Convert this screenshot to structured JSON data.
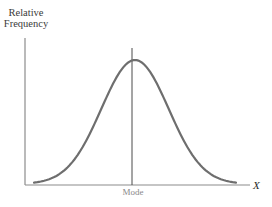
{
  "chart_data": {
    "type": "line",
    "title": "",
    "xlabel": "X",
    "ylabel": "Relative Frequency",
    "annotations": [
      {
        "label": "Mode",
        "position": "center, at peak of distribution"
      }
    ],
    "x": [
      -3,
      -2.5,
      -2,
      -1.5,
      -1,
      -0.5,
      0,
      0.5,
      1,
      1.5,
      2,
      2.5,
      3
    ],
    "series": [
      {
        "name": "Relative Frequency",
        "values": [
          0.011,
          0.044,
          0.135,
          0.325,
          0.607,
          0.882,
          1.0,
          0.882,
          0.607,
          0.325,
          0.135,
          0.044,
          0.011
        ]
      }
    ],
    "grid": false,
    "legend": "none",
    "colors": {
      "curve": "#6e6e6e",
      "axes": "#8c8c8c",
      "mode_line": "#4a4a4a"
    }
  },
  "labels": {
    "y_axis": [
      "Relative",
      "Frequency"
    ],
    "x_axis": "X",
    "mode": "Mode"
  }
}
